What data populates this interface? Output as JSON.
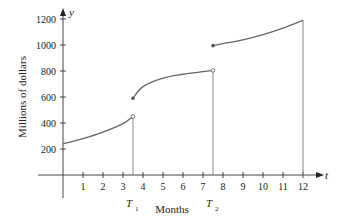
{
  "chart_data": {
    "type": "line",
    "title": "",
    "xlabel": "Months",
    "ylabel": "Millions of dollars",
    "x_axis_var": "t",
    "y_axis_var": "y",
    "x_ticks": [
      1,
      2,
      3,
      4,
      5,
      6,
      7,
      8,
      9,
      10,
      11,
      12
    ],
    "y_ticks": [
      200,
      400,
      600,
      800,
      1000,
      1200
    ],
    "xlim": [
      0,
      12.8
    ],
    "ylim": [
      0,
      1250
    ],
    "grid": false,
    "annotations": [
      {
        "label": "T",
        "subscript": "1",
        "x": 3.5
      },
      {
        "label": "T",
        "subscript": "2",
        "x": 7.5
      }
    ],
    "series": [
      {
        "name": "segment-1",
        "x": [
          0,
          1,
          2,
          3,
          3.5
        ],
        "y": [
          240,
          280,
          330,
          395,
          450
        ],
        "start": "closed",
        "end": "open"
      },
      {
        "name": "segment-2",
        "x": [
          3.5,
          4,
          5,
          6,
          7,
          7.5
        ],
        "y": [
          590,
          680,
          745,
          775,
          795,
          805
        ],
        "start": "closed",
        "end": "open"
      },
      {
        "name": "segment-3",
        "x": [
          7.5,
          8,
          9,
          10,
          11,
          12
        ],
        "y": [
          995,
          1010,
          1040,
          1080,
          1130,
          1190
        ],
        "start": "closed",
        "end": "closed"
      }
    ],
    "vertical_lines": [
      3.5,
      7.5,
      12
    ]
  }
}
